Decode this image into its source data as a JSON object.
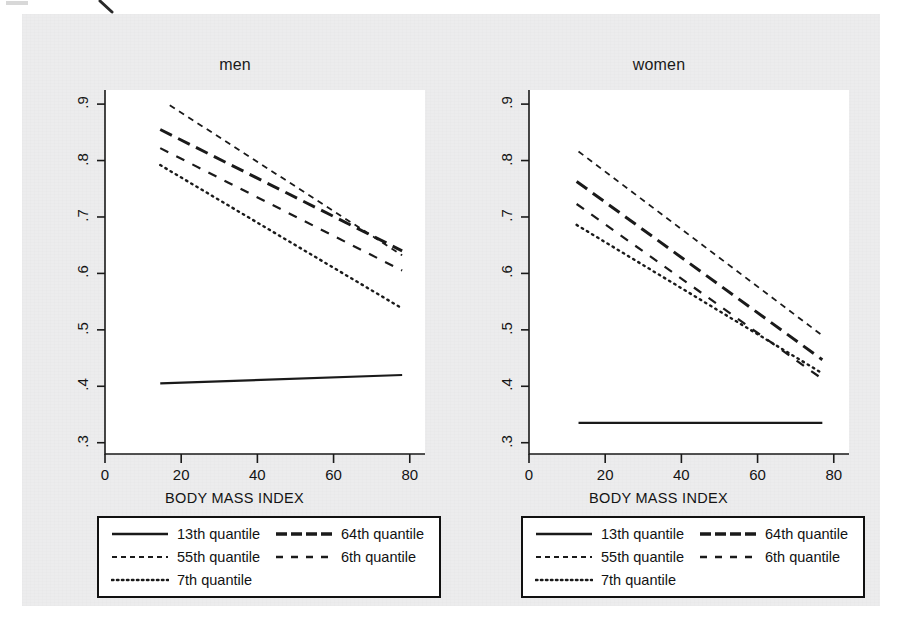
{
  "figure": {
    "background_color": "#ececed",
    "plot_background_color": "#ffffff",
    "line_color": "#1a1a1a"
  },
  "chart_data": {
    "type": "line",
    "title": "",
    "panels": [
      {
        "name": "men",
        "title": "men",
        "xlabel": "BODY MASS INDEX",
        "ylabel": "",
        "xlim": [
          0,
          84
        ],
        "ylim": [
          0.28,
          0.925
        ],
        "xticks": [
          0,
          20,
          40,
          60,
          80
        ],
        "yticks": [
          0.3,
          0.4,
          0.5,
          0.6,
          0.7,
          0.8,
          0.9
        ],
        "xtick_labels": [
          "0",
          "20",
          "40",
          "60",
          "80"
        ],
        "ytick_labels": [
          ".3",
          ".4",
          ".5",
          ".6",
          ".7",
          ".8",
          ".9"
        ],
        "grid": false,
        "series": [
          {
            "name": "13th quantile",
            "style": "solid",
            "width": 2.2,
            "x": [
              14.5,
              78
            ],
            "y": [
              0.405,
              0.42
            ]
          },
          {
            "name": "64th quantile",
            "style": "longdash",
            "width": 3.0,
            "x": [
              14.5,
              78
            ],
            "y": [
              0.855,
              0.64
            ]
          },
          {
            "name": "55th quantile",
            "style": "shortdash",
            "width": 1.8,
            "x": [
              17,
              78
            ],
            "y": [
              0.898,
              0.632
            ]
          },
          {
            "name": "6th quantile",
            "style": "dash",
            "width": 2.2,
            "x": [
              14.5,
              78
            ],
            "y": [
              0.822,
              0.605
            ]
          },
          {
            "name": "7th quantile",
            "style": "dotted",
            "width": 2.4,
            "x": [
              14.5,
              78
            ],
            "y": [
              0.792,
              0.538
            ]
          }
        ]
      },
      {
        "name": "women",
        "title": "women",
        "xlabel": "BODY MASS INDEX",
        "ylabel": "",
        "xlim": [
          0,
          84
        ],
        "ylim": [
          0.28,
          0.925
        ],
        "xticks": [
          0,
          20,
          40,
          60,
          80
        ],
        "yticks": [
          0.3,
          0.4,
          0.5,
          0.6,
          0.7,
          0.8,
          0.9
        ],
        "xtick_labels": [
          "0",
          "20",
          "40",
          "60",
          "80"
        ],
        "ytick_labels": [
          ".3",
          ".4",
          ".5",
          ".6",
          ".7",
          ".8",
          ".9"
        ],
        "grid": false,
        "series": [
          {
            "name": "13th quantile",
            "style": "solid",
            "width": 2.2,
            "x": [
              13,
              77
            ],
            "y": [
              0.335,
              0.335
            ]
          },
          {
            "name": "64th quantile",
            "style": "longdash",
            "width": 3.0,
            "x": [
              12.5,
              77
            ],
            "y": [
              0.763,
              0.447
            ]
          },
          {
            "name": "55th quantile",
            "style": "shortdash",
            "width": 1.8,
            "x": [
              13,
              77
            ],
            "y": [
              0.816,
              0.49
            ]
          },
          {
            "name": "6th quantile",
            "style": "dash",
            "width": 2.2,
            "x": [
              12.5,
              77
            ],
            "y": [
              0.723,
              0.413
            ]
          },
          {
            "name": "7th quantile",
            "style": "dotted",
            "width": 2.4,
            "x": [
              12.5,
              77
            ],
            "y": [
              0.686,
              0.423
            ]
          }
        ]
      }
    ],
    "legend": {
      "position": "below",
      "entries": [
        {
          "label": "13th quantile",
          "style": "solid"
        },
        {
          "label": "64th quantile",
          "style": "longdash"
        },
        {
          "label": "55th quantile",
          "style": "shortdash"
        },
        {
          "label": "6th quantile",
          "style": "dash"
        },
        {
          "label": "7th quantile",
          "style": "dotted"
        }
      ]
    }
  }
}
